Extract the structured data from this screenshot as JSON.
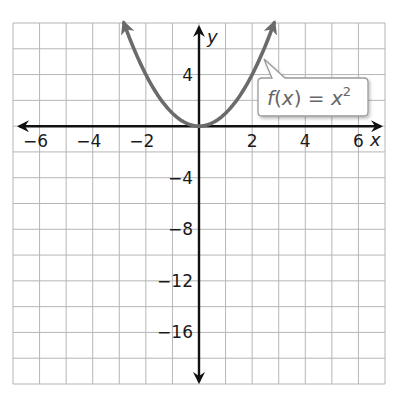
{
  "chart_data": {
    "type": "line",
    "title": "",
    "xlabel": "x",
    "ylabel": "y",
    "xlim": [
      -7,
      7
    ],
    "ylim": [
      -20,
      8
    ],
    "grid": true,
    "x_grid_step": 1,
    "y_grid_step": 2,
    "x_ticks": [
      -6,
      -4,
      -2,
      2,
      4,
      6
    ],
    "x_tick_labels": [
      "−6",
      "−4",
      "−2",
      "2",
      "4",
      "6"
    ],
    "y_ticks": [
      4,
      -4,
      -8,
      -12,
      -16
    ],
    "y_tick_labels": [
      "4",
      "−4",
      "−8",
      "−12",
      "−16"
    ],
    "series": [
      {
        "name": "f(x) = x^2",
        "function": "x^2",
        "x": [
          -2.83,
          -2.5,
          -2,
          -1.5,
          -1,
          -0.5,
          0,
          0.5,
          1,
          1.5,
          2,
          2.5,
          2.83
        ],
        "y": [
          8,
          6.25,
          4,
          2.25,
          1,
          0.25,
          0,
          0.25,
          1,
          2.25,
          4,
          6.25,
          8
        ],
        "color": "#6b6b6b",
        "arrows_at_ends": true
      }
    ],
    "annotations": [
      {
        "text": "f(x) = x²",
        "type": "callout",
        "points_to": [
          2.5,
          6.25
        ]
      }
    ],
    "legend": "none"
  },
  "labels": {
    "x_axis": "x",
    "y_axis": "y",
    "callout_f": "f",
    "callout_open": "(",
    "callout_x": "x",
    "callout_close": ")",
    "callout_eq": " = ",
    "callout_base": "x",
    "callout_exp": "2"
  },
  "colors": {
    "grid": "#b5b5b5",
    "axis": "#111111",
    "curve": "#6b6b6b",
    "callout_border": "#9a9a9a",
    "callout_text": "#666666"
  }
}
